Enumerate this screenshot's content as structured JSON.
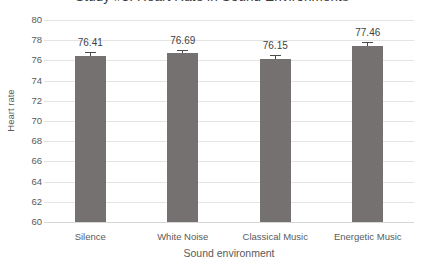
{
  "chart_data": {
    "type": "bar",
    "title": "Study #3: Heart Rate in Sound Environments",
    "xlabel": "Sound environment",
    "ylabel": "Heart rate",
    "categories": [
      "Silence",
      "White Noise",
      "Classical Music",
      "Energetic Music"
    ],
    "values": [
      76.41,
      76.69,
      76.15,
      77.46
    ],
    "value_labels": [
      "76.41",
      "76.69",
      "76.15",
      "77.46"
    ],
    "errors": [
      0.38,
      0.38,
      0.38,
      0.38
    ],
    "ylim": [
      60,
      80
    ],
    "ytick_step": 2,
    "yticks": [
      "80",
      "78",
      "76",
      "74",
      "72",
      "70",
      "68",
      "66",
      "64",
      "62",
      "60"
    ],
    "grid": true,
    "legend": null,
    "bar_color": "#767171",
    "error_bar_color": "#4a4a4a",
    "gridline_color": "#e4e4e4",
    "text_color": "#5a5a5a"
  }
}
